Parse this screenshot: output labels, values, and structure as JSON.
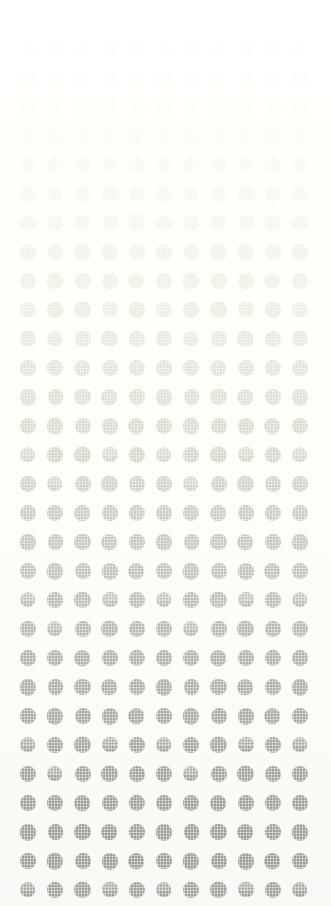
{
  "canvas": {
    "width": 331,
    "height": 906,
    "background_color": "#fefefa",
    "description": "halftone-dot-gradient-pattern"
  },
  "pattern": {
    "name": "dot-grid",
    "shape": "circle",
    "columns": 11,
    "rows": 31,
    "first_dot_center_x": 28,
    "first_dot_center_y": 20,
    "column_spacing": 27.2,
    "row_spacing": 29.0,
    "dot_diameter": 16,
    "texture": "halftone-screen",
    "gradient_direction": "top-to-bottom",
    "gradient_start_color": "#fdfdf2",
    "gradient_mid_color": "#cfcfc4",
    "gradient_end_color": "#9b9b93",
    "opacity_start": 0.1,
    "opacity_end": 1.0
  },
  "chart_data": {
    "type": "heatmap",
    "title": "",
    "xlabel": "",
    "ylabel": "",
    "grid": true,
    "legend": "none",
    "columns": 11,
    "rows": 31,
    "row_tone_hex": [
      "#fdfdf3",
      "#fcfcf1",
      "#fafaee",
      "#f8f8ea",
      "#f5f5e6",
      "#f2f2e1",
      "#eeeedc",
      "#eaead6",
      "#e6e6d1",
      "#e2e2cc",
      "#dedec8",
      "#dadac4",
      "#d6d6c1",
      "#d2d2be",
      "#cecebb",
      "#cacab8",
      "#c5c5b5",
      "#c0c0b2",
      "#bcbcaf",
      "#b8b8ac",
      "#b4b4a9",
      "#b0b0a6",
      "#ababa3",
      "#a8a8a1",
      "#a5a59e",
      "#a2a29b",
      "#a0a099",
      "#9e9e97",
      "#9c9c95",
      "#9a9a93",
      "#989891"
    ],
    "row_opacity": [
      0.08,
      0.11,
      0.15,
      0.19,
      0.24,
      0.29,
      0.34,
      0.39,
      0.44,
      0.49,
      0.54,
      0.59,
      0.63,
      0.67,
      0.71,
      0.75,
      0.78,
      0.81,
      0.84,
      0.86,
      0.88,
      0.9,
      0.92,
      0.93,
      0.95,
      0.96,
      0.97,
      0.98,
      0.99,
      1.0,
      1.0
    ]
  }
}
